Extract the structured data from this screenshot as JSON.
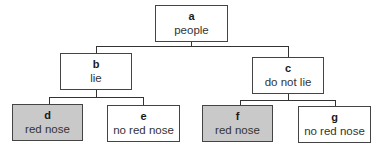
{
  "diagram": {
    "type": "tree",
    "colors": {
      "shaded_fill": "#c9c9c9",
      "border": "#444444",
      "line": "#333333"
    },
    "nodes": {
      "a": {
        "id": "a",
        "label": "people",
        "shaded": false
      },
      "b": {
        "id": "b",
        "label": "lie",
        "shaded": false
      },
      "c": {
        "id": "c",
        "label": "do not lie",
        "shaded": false
      },
      "d": {
        "id": "d",
        "label": "red nose",
        "shaded": true
      },
      "e": {
        "id": "e",
        "label": "no red nose",
        "shaded": false
      },
      "f": {
        "id": "f",
        "label": "red nose",
        "shaded": true
      },
      "g": {
        "id": "g",
        "label": "no red nose",
        "shaded": false
      }
    },
    "edges": [
      [
        "a",
        "b"
      ],
      [
        "a",
        "c"
      ],
      [
        "b",
        "d"
      ],
      [
        "b",
        "e"
      ],
      [
        "c",
        "f"
      ],
      [
        "c",
        "g"
      ]
    ]
  }
}
